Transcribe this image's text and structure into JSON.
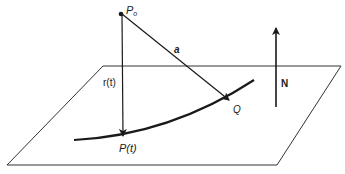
{
  "diagram": {
    "labels": {
      "p0": "P",
      "p0_sub": "o",
      "vector_a": "a",
      "r_of_t": "r(t)",
      "p_of_t": "P(t)",
      "q": "Q",
      "normal": "N"
    },
    "colors": {
      "stroke": "#1a1a1a",
      "plane": "#333333",
      "text": "#222222",
      "background": "#ffffff"
    }
  }
}
